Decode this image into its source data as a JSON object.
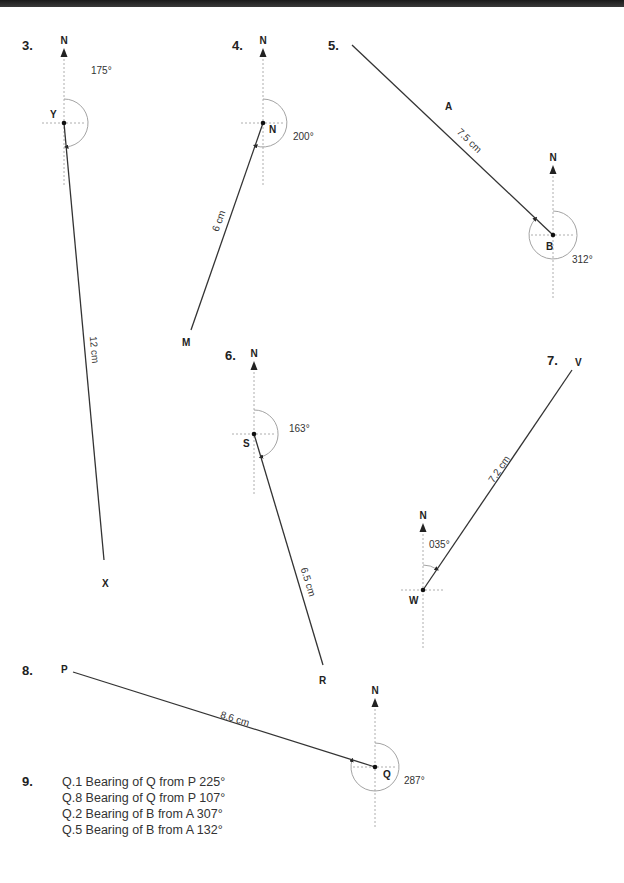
{
  "page": {
    "type": "worksheet-bearings-answers",
    "background": "#ffffff",
    "line_color": "#333333",
    "guide_color": "#999999"
  },
  "diagrams": [
    {
      "number": "3.",
      "num_pos": [
        22,
        50
      ],
      "north_label": "N",
      "center": [
        64,
        123
      ],
      "center_label": "Y",
      "center_label_pos": [
        50,
        118
      ],
      "end": [
        104,
        560
      ],
      "end_label": "X",
      "end_label_pos": [
        102,
        587
      ],
      "distance": "12 cm",
      "distance_pos": [
        91,
        350
      ],
      "distance_rot": 85,
      "bearing": "175°",
      "bearing_pos": [
        91,
        74
      ],
      "arc_r": 24,
      "north_top": 45,
      "south_bottom": 185
    },
    {
      "number": "4.",
      "num_pos": [
        232,
        50
      ],
      "north_label": "N",
      "center": [
        263,
        123
      ],
      "center_label": "N",
      "center_label_pos": [
        269,
        133
      ],
      "end": [
        191,
        330
      ],
      "end_label": "M",
      "end_label_pos": [
        182,
        346
      ],
      "distance": "6 cm",
      "distance_pos": [
        222,
        222
      ],
      "distance_rot": -70,
      "bearing": "200°",
      "bearing_pos": [
        293,
        140
      ],
      "arc_r": 24,
      "north_top": 45,
      "south_bottom": 185
    },
    {
      "number": "5.",
      "num_pos": [
        328,
        50
      ],
      "north_label": "N",
      "center": [
        553,
        235
      ],
      "center_label": "B",
      "center_label_pos": [
        546,
        250
      ],
      "end": [
        352,
        45
      ],
      "end_label": "A",
      "end_label_pos": [
        445,
        110
      ],
      "distance": "7.5 cm",
      "distance_pos": [
        467,
        143
      ],
      "distance_rot": 44,
      "bearing": "312°",
      "bearing_pos": [
        572,
        263
      ],
      "arc_r": 24,
      "north_top": 162,
      "south_bottom": 298
    },
    {
      "number": "6.",
      "num_pos": [
        225,
        360
      ],
      "north_label": "N",
      "center": [
        254,
        434
      ],
      "center_label": "S",
      "center_label_pos": [
        243,
        447
      ],
      "end": [
        323,
        665
      ],
      "end_label": "R",
      "end_label_pos": [
        319,
        684
      ],
      "distance": "6.5 cm",
      "distance_pos": [
        305,
        583
      ],
      "distance_rot": 73,
      "bearing": "163°",
      "bearing_pos": [
        289,
        432
      ],
      "arc_r": 24,
      "north_top": 358,
      "south_bottom": 496
    },
    {
      "number": "7.",
      "num_pos": [
        547,
        365
      ],
      "north_label": "N",
      "center": [
        423,
        590
      ],
      "center_label": "W",
      "center_label_pos": [
        409,
        604
      ],
      "end": [
        572,
        370
      ],
      "end_label": "V",
      "end_label_pos": [
        575,
        366
      ],
      "distance": "7.2 cm",
      "distance_pos": [
        502,
        471
      ],
      "distance_rot": -56,
      "bearing": "035°",
      "bearing_pos": [
        429,
        548
      ],
      "arc_r": 25,
      "north_top": 520,
      "south_bottom": 650
    },
    {
      "number": "8.",
      "num_pos": [
        22,
        675
      ],
      "north_label": "N",
      "center": [
        375,
        767
      ],
      "center_label": "Q",
      "center_label_pos": [
        383,
        778
      ],
      "end": [
        73,
        672
      ],
      "end_label": "P",
      "end_label_pos": [
        61,
        673
      ],
      "distance": "8.6 cm",
      "distance_pos": [
        234,
        722
      ],
      "distance_rot": 17,
      "bearing": "287°",
      "bearing_pos": [
        404,
        784
      ],
      "arc_r": 24,
      "north_top": 695,
      "south_bottom": 828
    }
  ],
  "answers": {
    "number": "9.",
    "items": [
      "Q.1 Bearing of Q from P 225°",
      "Q.8 Bearing of Q from P 107°",
      "Q.2 Bearing of B from A 307°",
      "Q.5 Bearing of B from A 132°"
    ]
  }
}
